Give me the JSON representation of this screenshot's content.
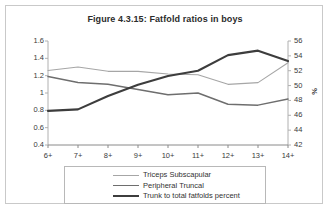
{
  "figure": {
    "title": "Figure 4.3.15: Fatfold ratios in boys"
  },
  "chart_data": {
    "type": "line",
    "title": "Figure 4.3.15: Fatfold ratios in boys",
    "xlabel": "",
    "ylabel": "",
    "y2label": "%",
    "grid": false,
    "legend_position": "bottom",
    "categories": [
      "6+",
      "7+",
      "8+",
      "9+",
      "10+",
      "11+",
      "12+",
      "13+",
      "14+"
    ],
    "ylim": [
      0.4,
      1.6
    ],
    "yticks": [
      "1.6",
      "1.4",
      "1.2",
      "1",
      "0.8",
      "0.6",
      "0.4"
    ],
    "y2lim": [
      42,
      56
    ],
    "y2ticks": [
      "56",
      "54",
      "52",
      "50",
      "48",
      "46",
      "44",
      "42"
    ],
    "series": [
      {
        "name": "Triceps Subscapular",
        "axis": "left",
        "color": "#a6a6a6",
        "width": 1.1,
        "values": [
          1.26,
          1.3,
          1.25,
          1.25,
          1.22,
          1.21,
          1.1,
          1.12,
          1.35
        ]
      },
      {
        "name": "Peripheral Truncal",
        "axis": "left",
        "color": "#6e6e6e",
        "width": 1.5,
        "values": [
          1.19,
          1.12,
          1.1,
          1.04,
          0.98,
          1.0,
          0.87,
          0.86,
          0.93
        ]
      },
      {
        "name": "Trunk to total fatfolds percent",
        "axis": "right",
        "color": "#3d3d3d",
        "width": 2.1,
        "values": [
          46.6,
          46.8,
          48.6,
          50.1,
          51.3,
          52.0,
          54.1,
          54.7,
          53.3
        ]
      }
    ]
  },
  "legend": {
    "items": [
      {
        "label": "Triceps Subscapular"
      },
      {
        "label": "Peripheral Truncal"
      },
      {
        "label": "Trunk to total fatfolds percent"
      }
    ]
  }
}
